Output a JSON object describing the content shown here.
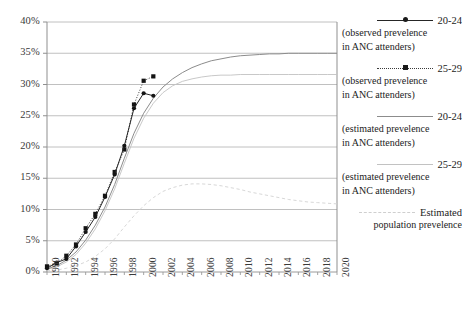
{
  "chart_data": {
    "type": "line",
    "title": "",
    "xlabel": "",
    "ylabel": "",
    "xlim": [
      1990,
      2020
    ],
    "ylim": [
      0,
      40
    ],
    "ytick_labels": [
      "0%",
      "5%",
      "10%",
      "15%",
      "20%",
      "25%",
      "30%",
      "35%",
      "40%"
    ],
    "ytick_values": [
      0,
      5,
      10,
      15,
      20,
      25,
      30,
      35,
      40
    ],
    "xtick_labels": [
      "1990",
      "1992",
      "1994",
      "1996",
      "1998",
      "2000",
      "2002",
      "2004",
      "2006",
      "2008",
      "2010",
      "2012",
      "2014",
      "2016",
      "2018",
      "2020"
    ],
    "xtick_values": [
      1990,
      1992,
      1994,
      1996,
      1998,
      2000,
      2002,
      2004,
      2006,
      2008,
      2010,
      2012,
      2014,
      2016,
      2018,
      2020
    ],
    "grid": "horizontal",
    "legend_position": "right",
    "series": [
      {
        "name": "20-24 (observed prevelence in ANC attenders)",
        "style": "solid",
        "marker": "circle",
        "color": "#262626",
        "x": [
          1990,
          1991,
          1992,
          1993,
          1994,
          1995,
          1996,
          1997,
          1998,
          1999,
          2000,
          2001
        ],
        "y": [
          0.6,
          1.5,
          2.1,
          4.1,
          6.4,
          8.8,
          12.0,
          15.6,
          20.2,
          26.2,
          28.6,
          28.2
        ]
      },
      {
        "name": "25-29 (observed prevelence in ANC attenders)",
        "style": "dotted",
        "marker": "square",
        "color": "#3a3a3a",
        "x": [
          1990,
          1991,
          1992,
          1993,
          1994,
          1995,
          1996,
          1997,
          1998,
          1999,
          2000,
          2001
        ],
        "y": [
          0.9,
          1.4,
          2.6,
          4.4,
          7.0,
          9.3,
          12.2,
          16.0,
          19.6,
          26.8,
          30.6,
          31.3
        ]
      },
      {
        "name": "20-24 (estimated prevelence in ANC attenders)",
        "style": "solid",
        "marker": "none",
        "color": "#8c8c8c",
        "x": [
          1990,
          1991,
          1992,
          1993,
          1994,
          1995,
          1996,
          1997,
          1998,
          1999,
          2000,
          2001,
          2002,
          2003,
          2004,
          2005,
          2006,
          2007,
          2008,
          2009,
          2010,
          2011,
          2012,
          2013,
          2014,
          2015,
          2016,
          2017,
          2018,
          2019,
          2020
        ],
        "y": [
          0.5,
          1.0,
          1.9,
          3.2,
          5.1,
          7.5,
          10.4,
          14.0,
          18.2,
          22.2,
          25.4,
          27.8,
          29.6,
          30.9,
          31.9,
          32.7,
          33.3,
          33.8,
          34.1,
          34.4,
          34.6,
          34.7,
          34.8,
          34.9,
          34.9,
          35.0,
          35.0,
          35.0,
          35.0,
          35.0,
          35.0
        ]
      },
      {
        "name": "25-29 (estimated prevelence in ANC attenders)",
        "style": "solid",
        "marker": "none",
        "color": "#c2c2c2",
        "x": [
          1990,
          1991,
          1992,
          1993,
          1994,
          1995,
          1996,
          1997,
          1998,
          1999,
          2000,
          2001,
          2002,
          2003,
          2004,
          2005,
          2006,
          2007,
          2008,
          2009,
          2010,
          2011,
          2012,
          2013,
          2014,
          2015,
          2016,
          2017,
          2018,
          2019,
          2020
        ],
        "y": [
          0.4,
          0.8,
          1.6,
          2.8,
          4.6,
          6.9,
          9.8,
          13.3,
          17.4,
          21.4,
          24.6,
          27.0,
          28.7,
          29.8,
          30.5,
          30.9,
          31.2,
          31.4,
          31.5,
          31.5,
          31.6,
          31.6,
          31.6,
          31.6,
          31.6,
          31.6,
          31.6,
          31.6,
          31.6,
          31.6,
          31.6
        ]
      },
      {
        "name": "Estimated population prevelence",
        "style": "dashed",
        "marker": "none",
        "color": "#d2d2d2",
        "x": [
          1990,
          1991,
          1992,
          1993,
          1994,
          1995,
          1996,
          1997,
          1998,
          1999,
          2000,
          2001,
          2002,
          2003,
          2004,
          2005,
          2006,
          2007,
          2008,
          2009,
          2010,
          2011,
          2012,
          2013,
          2014,
          2015,
          2016,
          2017,
          2018,
          2019,
          2020
        ],
        "y": [
          0.2,
          0.3,
          0.6,
          1.0,
          1.6,
          2.5,
          3.7,
          5.3,
          7.2,
          9.0,
          10.6,
          11.9,
          12.9,
          13.5,
          13.9,
          14.1,
          14.1,
          14.0,
          13.8,
          13.5,
          13.2,
          12.8,
          12.5,
          12.2,
          11.9,
          11.6,
          11.4,
          11.2,
          11.1,
          11.0,
          10.9
        ]
      }
    ]
  },
  "legend": {
    "entries": [
      {
        "title": "20-24",
        "sub1": "(observed prevelence",
        "sub2": "in ANC attenders)",
        "sample": "solid-circle"
      },
      {
        "title": "25-29",
        "sub1": "(observed prevelence",
        "sub2": "in ANC attenders)",
        "sample": "dotted-square"
      },
      {
        "title": "20-24",
        "sub1": "(estimated prevelence",
        "sub2": "in ANC attenders)",
        "sample": "solid-gray"
      },
      {
        "title": "25-29",
        "sub1": "(estimated prevelence",
        "sub2": "in ANC attenders)",
        "sample": "solid-lightgray"
      },
      {
        "title": "Estimated",
        "sub1": "population prevelence",
        "sub2": "",
        "sample": "dashed-lightgray"
      }
    ]
  }
}
